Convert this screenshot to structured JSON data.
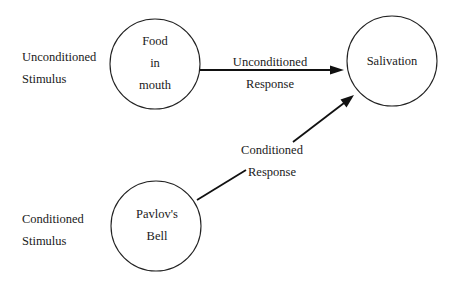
{
  "diagram": {
    "side_labels": {
      "unconditioned_stimulus": [
        "Unconditioned",
        "Stimulus"
      ],
      "conditioned_stimulus": [
        "Conditioned",
        "Stimulus"
      ]
    },
    "nodes": {
      "food": {
        "lines": [
          "Food",
          "in",
          "mouth"
        ],
        "cx": 155,
        "cy": 64,
        "r": 45
      },
      "salivation": {
        "lines": [
          "Salivation"
        ],
        "cx": 392,
        "cy": 61,
        "r": 45
      },
      "bell": {
        "lines": [
          "Pavlov's",
          "Bell"
        ],
        "cx": 156,
        "cy": 226,
        "r": 45
      }
    },
    "edges": {
      "unconditioned_response": {
        "from": "food",
        "to": "salivation",
        "label": [
          "Unconditioned",
          "Response"
        ]
      },
      "conditioned_response": {
        "from": "bell",
        "to": "salivation",
        "label": [
          "Conditioned",
          "Response"
        ]
      }
    },
    "colors": {
      "stroke": "#111111",
      "background": "#ffffff",
      "text": "#1a1a1a"
    }
  }
}
